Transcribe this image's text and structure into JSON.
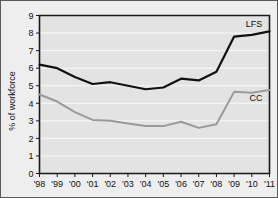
{
  "chart_data": {
    "type": "line",
    "title": "",
    "xlabel": "",
    "ylabel": "% of workforce",
    "categories": [
      "'98",
      "'99",
      "'00",
      "'01",
      "'02",
      "'03",
      "'04",
      "'05",
      "'06",
      "'07",
      "'08",
      "'09",
      "'10",
      "'11"
    ],
    "x_tick_labels": [
      "'98",
      "'99",
      "'00",
      "'01",
      "'02",
      "'03",
      "'04",
      "'05",
      "'06",
      "'07",
      "'08",
      "'09",
      "'10",
      "'11"
    ],
    "y_tick_labels": [
      "0",
      "1",
      "2",
      "3",
      "4",
      "5",
      "6",
      "7",
      "8",
      "9"
    ],
    "ylim": [
      0,
      9
    ],
    "y_major_step": 1,
    "grid": true,
    "grid_axis": "y",
    "legend": "inline-end-labels",
    "series": [
      {
        "name": "LFS",
        "label": "LFS",
        "color": "#111111",
        "values": [
          6.2,
          6.0,
          5.5,
          5.1,
          5.2,
          5.0,
          4.8,
          4.9,
          5.4,
          5.3,
          5.8,
          7.8,
          7.9,
          8.1
        ]
      },
      {
        "name": "CC",
        "label": "CC",
        "color": "#9a9a9a",
        "values": [
          4.5,
          4.1,
          3.5,
          3.05,
          3.0,
          2.85,
          2.7,
          2.7,
          2.95,
          2.6,
          2.8,
          4.65,
          4.6,
          4.75
        ]
      }
    ]
  },
  "figure": {
    "background_color": "#eeeeee",
    "plot_background_color": "#e3e3e3",
    "border_color": "#5a5a5a"
  }
}
